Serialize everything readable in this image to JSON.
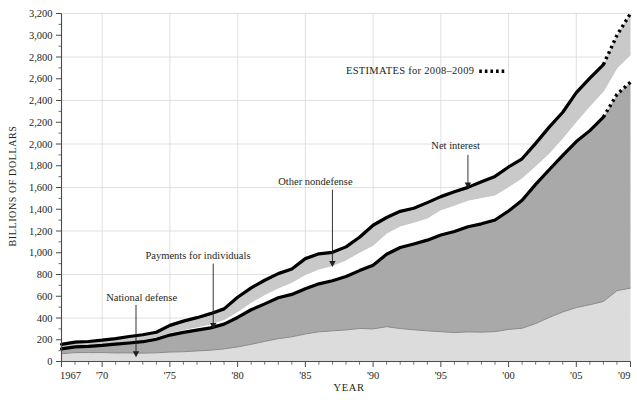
{
  "chart_data": {
    "type": "area",
    "title": "",
    "xlabel": "YEAR",
    "ylabel": "BILLIONS OF DOLLARS",
    "xlim": [
      1967,
      2009
    ],
    "ylim": [
      0,
      3200
    ],
    "grid": true,
    "legend_position": "inline-annotations",
    "y_ticks": [
      0,
      200,
      400,
      600,
      800,
      1000,
      1200,
      1400,
      1600,
      1800,
      2000,
      2200,
      2400,
      2600,
      2800,
      3000,
      3200
    ],
    "y_tick_labels": [
      "0",
      "200",
      "400",
      "600",
      "800",
      "1,000",
      "1,200",
      "1,400",
      "1,600",
      "1,800",
      "2,000",
      "2,200",
      "2,400",
      "2,600",
      "2,800",
      "3,000",
      "3,200"
    ],
    "y_minor_tick_step": 100,
    "x_ticks": [
      1967,
      1970,
      1975,
      1980,
      1985,
      1990,
      1995,
      2000,
      2005,
      2009
    ],
    "x_tick_labels": [
      "1967",
      "'70",
      "'75",
      "'80",
      "'85",
      "'90",
      "'95",
      "'00",
      "'05",
      "'09"
    ],
    "x_gridlines": [
      1970,
      1975,
      1980,
      1985,
      1990,
      1995,
      2000,
      2005
    ],
    "y_gridlines": [
      400,
      800,
      1200,
      1600,
      2000,
      2400,
      2800,
      3200
    ],
    "x": [
      1967,
      1968,
      1969,
      1970,
      1971,
      1972,
      1973,
      1974,
      1975,
      1976,
      1977,
      1978,
      1979,
      1980,
      1981,
      1982,
      1983,
      1984,
      1985,
      1986,
      1987,
      1988,
      1989,
      1990,
      1991,
      1992,
      1993,
      1994,
      1995,
      1996,
      1997,
      1998,
      1999,
      2000,
      2001,
      2002,
      2003,
      2004,
      2005,
      2006,
      2007,
      2008,
      2009
    ],
    "stack_order_bottom_to_top": [
      "National defense",
      "Payments for individuals",
      "Net interest",
      "Other nondefense"
    ],
    "series": [
      {
        "name": "National defense",
        "color": "#dcdcdc",
        "values": [
          71,
          82,
          82,
          82,
          79,
          79,
          77,
          80,
          87,
          90,
          97,
          104,
          116,
          134,
          158,
          185,
          210,
          227,
          253,
          273,
          282,
          290,
          304,
          300,
          320,
          303,
          292,
          282,
          274,
          266,
          272,
          270,
          275,
          295,
          306,
          349,
          405,
          456,
          496,
          522,
          552,
          651,
          675
        ]
      },
      {
        "name": "Payments for individuals",
        "color": "#a9a9a9",
        "values": [
          45,
          52,
          57,
          66,
          81,
          91,
          105,
          125,
          156,
          178,
          191,
          205,
          228,
          271,
          318,
          345,
          376,
          390,
          416,
          441,
          461,
          491,
          532,
          585,
          666,
          745,
          789,
          834,
          889,
          930,
          967,
          996,
          1026,
          1089,
          1177,
          1280,
          1358,
          1440,
          1526,
          1601,
          1695,
          1805,
          1895
        ]
      },
      {
        "name": "Net interest",
        "color": "#ffffff",
        "values": [
          10,
          11,
          12,
          14,
          15,
          15,
          17,
          21,
          23,
          27,
          30,
          35,
          42,
          53,
          69,
          85,
          90,
          111,
          130,
          136,
          139,
          152,
          169,
          184,
          194,
          199,
          199,
          203,
          232,
          241,
          244,
          241,
          230,
          223,
          206,
          171,
          153,
          160,
          184,
          227,
          238,
          244,
          250
        ]
      },
      {
        "name": "Other nondefense",
        "color": "#c9c9c9",
        "values": [
          32,
          33,
          33,
          34,
          36,
          45,
          47,
          43,
          66,
          76,
          85,
          96,
          98,
          133,
          132,
          132,
          132,
          123,
          147,
          140,
          122,
          121,
          137,
          184,
          144,
          134,
          129,
          142,
          121,
          123,
          118,
          146,
          171,
          182,
          175,
          206,
          239,
          236,
          266,
          256,
          245,
          300,
          380
        ]
      }
    ],
    "annotations": [
      {
        "label": "National defense",
        "arrow_year": 1972.5,
        "arrow_value_top": 520,
        "arrow_value_tip": 40,
        "text_x_year": 1970.3,
        "text_y_value": 560
      },
      {
        "label": "Payments for individuals",
        "arrow_year": 1978.2,
        "arrow_value_top": 900,
        "arrow_value_tip": 300,
        "text_x_year": 1973.2,
        "text_y_value": 940
      },
      {
        "label": "Other nondefense",
        "arrow_year": 1987.0,
        "arrow_value_top": 1580,
        "arrow_value_tip": 870,
        "text_x_year": 1983.0,
        "text_y_value": 1620
      },
      {
        "label": "Net interest",
        "arrow_year": 1997.0,
        "arrow_value_top": 1900,
        "arrow_value_tip": 1590,
        "text_x_year": 1994.3,
        "text_y_value": 1950
      }
    ],
    "estimates_note": {
      "text": "ESTIMATES for 2008–2009",
      "marker": "dotted-line",
      "text_x_year": 1988.0,
      "text_y_value": 2640
    },
    "estimate_start_year": 2007
  }
}
